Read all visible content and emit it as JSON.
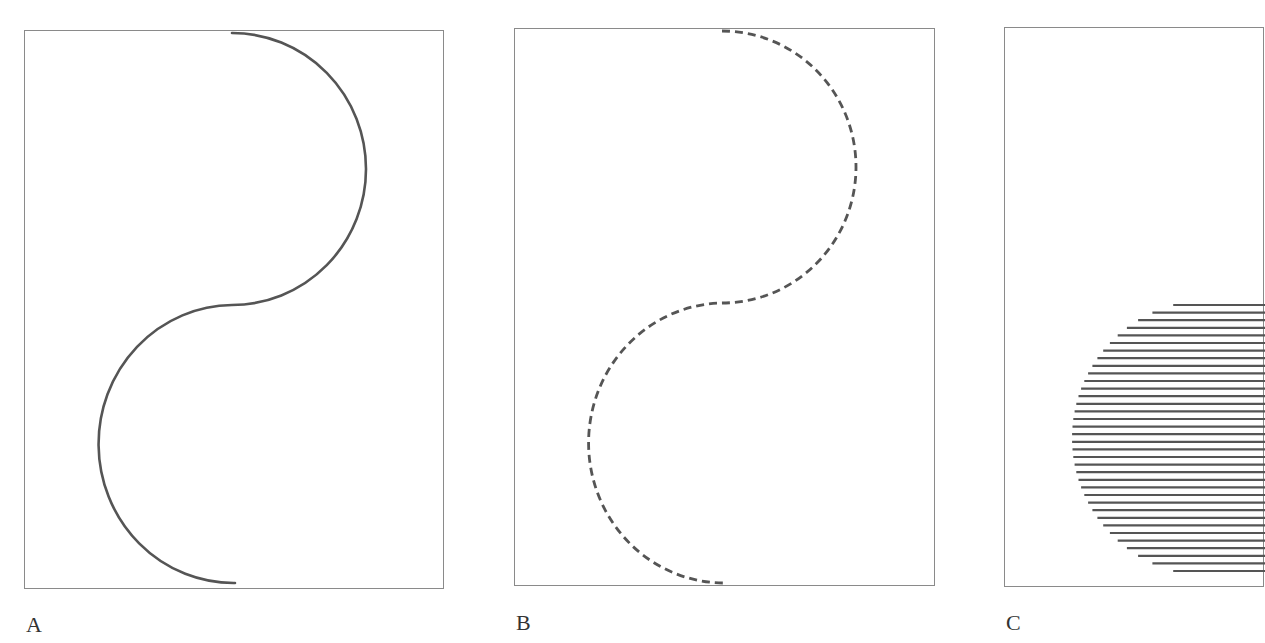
{
  "figure": {
    "panels": [
      {
        "label": "A",
        "style": "solid curve",
        "description": "S-shaped curve composed of two semicircular arcs"
      },
      {
        "label": "B",
        "style": "dashed curve",
        "description": "Same S-shaped curve drawn with dashed stroke"
      },
      {
        "label": "C",
        "style": "horizontal hatching",
        "description": "Semicircular region filled with horizontal line hatching",
        "hatch_line_count": 36
      }
    ]
  },
  "colors": {
    "stroke": "#555555",
    "frame": "#8a8a8a",
    "label": "#333333"
  }
}
